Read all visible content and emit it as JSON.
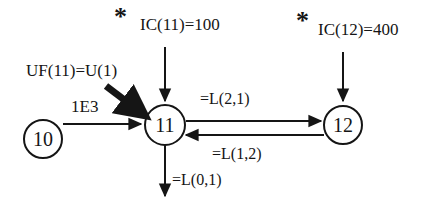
{
  "diagram": {
    "background_color": "#ffffff",
    "stroke_color": "#151515",
    "nodes": [
      {
        "id": "node-10",
        "label": "10",
        "cx": 43,
        "cy": 139,
        "r": 19
      },
      {
        "id": "node-11",
        "label": "11",
        "cx": 165,
        "cy": 125,
        "r": 20
      },
      {
        "id": "node-12",
        "label": "12",
        "cx": 343,
        "cy": 125,
        "r": 19
      }
    ],
    "markers": [
      {
        "id": "star-left",
        "glyph": "*",
        "meaning": "asterisk-annotation",
        "x": 118,
        "y": 14
      },
      {
        "id": "star-right",
        "glyph": "*",
        "meaning": "asterisk-annotation",
        "x": 300,
        "y": 18
      }
    ],
    "labels": {
      "ic_11": "IC(11)=100",
      "ic_12": "IC(12)=400",
      "uf_11": "UF(11)=U(1)",
      "flow_1e3": "1E3",
      "link_2_1": "=L(2,1)",
      "link_1_2": "=L(1,2)",
      "link_0_1": "=L(0,1)"
    },
    "edges": [
      {
        "id": "edge-ic11-to-node11",
        "from": "IC(11)=100",
        "to": "node-11",
        "label": "IC(11)=100",
        "direction": "down",
        "weight": "thin"
      },
      {
        "id": "edge-ic12-to-node12",
        "from": "IC(12)=400",
        "to": "node-12",
        "label": "IC(12)=400",
        "direction": "down",
        "weight": "thin"
      },
      {
        "id": "edge-uf11-to-node11",
        "from": "UF(11)=U(1)",
        "to": "node-11",
        "label": "UF(11)=U(1)",
        "direction": "down-right",
        "weight": "thick"
      },
      {
        "id": "edge-node10-to-node11",
        "from": "node-10",
        "to": "node-11",
        "label": "1E3",
        "direction": "right",
        "weight": "thin"
      },
      {
        "id": "edge-node11-to-node12",
        "from": "node-11",
        "to": "node-12",
        "label": "=L(2,1)",
        "direction": "right",
        "weight": "thin"
      },
      {
        "id": "edge-node12-to-node11",
        "from": "node-12",
        "to": "node-11",
        "label": "=L(1,2)",
        "direction": "left",
        "weight": "thin"
      },
      {
        "id": "edge-node11-to-sink",
        "from": "node-11",
        "to": "sink",
        "label": "=L(0,1)",
        "direction": "down",
        "weight": "thin"
      }
    ]
  }
}
